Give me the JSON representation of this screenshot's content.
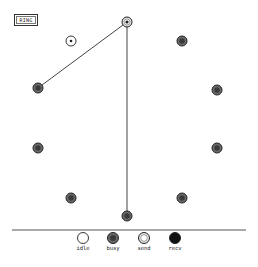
{
  "title": "RING",
  "colors": {
    "line": "#444444",
    "idle_fill": "#ffffff",
    "busy_fill": "#6a6a6a",
    "send_fill": "#e6e6e6",
    "recv_fill": "#111111",
    "stroke": "#222222"
  },
  "nodes": [
    {
      "id": 0,
      "x": 127,
      "y": 22,
      "state": "send"
    },
    {
      "id": 1,
      "x": 182,
      "y": 41,
      "state": "busy"
    },
    {
      "id": 2,
      "x": 217,
      "y": 90,
      "state": "busy"
    },
    {
      "id": 3,
      "x": 217,
      "y": 148,
      "state": "busy"
    },
    {
      "id": 4,
      "x": 182,
      "y": 198,
      "state": "busy"
    },
    {
      "id": 5,
      "x": 127,
      "y": 216,
      "state": "busy"
    },
    {
      "id": 6,
      "x": 71,
      "y": 198,
      "state": "busy"
    },
    {
      "id": 7,
      "x": 38,
      "y": 148,
      "state": "busy"
    },
    {
      "id": 8,
      "x": 38,
      "y": 88,
      "state": "busy"
    }
  ],
  "extra_nodes": [
    {
      "x": 71,
      "y": 41,
      "state": "idle"
    }
  ],
  "edges": [
    {
      "from": 0,
      "to": 8
    },
    {
      "from": 0,
      "to": 5
    }
  ],
  "divider": {
    "y": 230,
    "x1": 12,
    "x2": 246
  },
  "legend": [
    {
      "label": "idle",
      "state": "idle",
      "x": 83
    },
    {
      "label": "busy",
      "state": "busy",
      "x": 113
    },
    {
      "label": "send",
      "state": "send",
      "x": 144
    },
    {
      "label": "recv",
      "state": "recv",
      "x": 175
    }
  ]
}
